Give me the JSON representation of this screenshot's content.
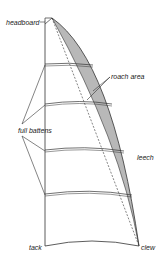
{
  "diagram": {
    "labels": {
      "headboard": "headboard",
      "roach_area": "roach area",
      "full_battens": "full battens",
      "leech": "leech",
      "tack": "tack",
      "clew": "clew"
    },
    "colors": {
      "line": "#333333",
      "roach_fill": "#b8b8b8",
      "background": "#ffffff"
    },
    "batten_count": 4
  }
}
